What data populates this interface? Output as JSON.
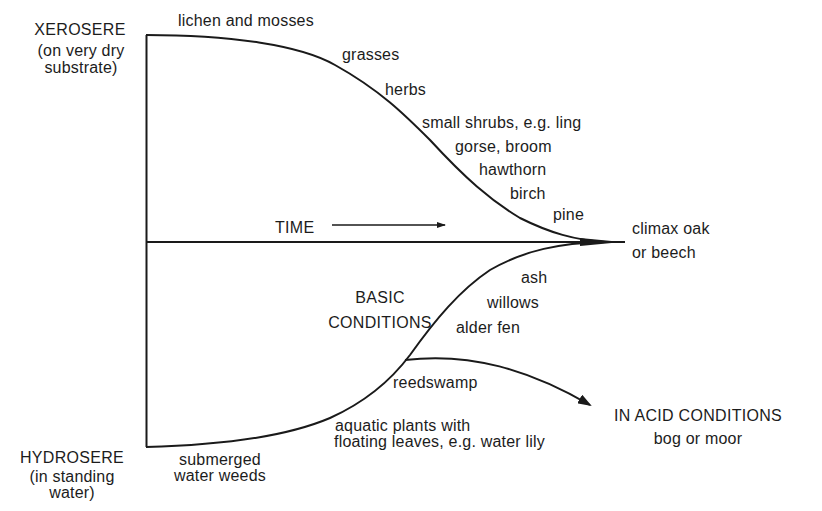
{
  "diagram": {
    "type": "ecological-succession",
    "xerosere": {
      "title": "XEROSERE",
      "subtitle_line1": "(on very dry",
      "subtitle_line2": "substrate)",
      "stages": [
        "lichen and mosses",
        "grasses",
        "herbs",
        "small shrubs, e.g. ling",
        "gorse, broom",
        "hawthorn",
        "birch",
        "pine"
      ]
    },
    "time_axis": {
      "label": "TIME"
    },
    "climax": {
      "line1": "climax oak",
      "line2": "or beech"
    },
    "hydrosere": {
      "title": "HYDROSERE",
      "subtitle_line1": "(in standing",
      "subtitle_line2": "water)",
      "condition_line1": "BASIC",
      "condition_line2": "CONDITIONS",
      "stages": [
        "submerged",
        "water weeds",
        "aquatic plants with",
        "floating leaves, e.g. water lily",
        "reedswamp",
        "alder fen",
        "willows",
        "ash"
      ]
    },
    "acid_branch": {
      "line1": "IN ACID CONDITIONS",
      "line2": "bog or moor"
    },
    "colors": {
      "line": "#1a1a1a",
      "background": "#ffffff"
    }
  }
}
